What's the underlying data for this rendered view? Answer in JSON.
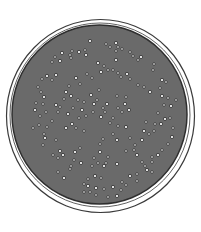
{
  "figure": {
    "subject": "Petri dish with bacterial colonies",
    "colors": {
      "background": "#ffffff",
      "rim_line": "#3a3a3a",
      "rim_fill": "#ffffff",
      "agar": "#6a6a6a",
      "agar_edge": "#2e2e2e",
      "colony_fill": "#f4f4f4",
      "colony_outline": "#1e1e1e"
    },
    "dish": {
      "outer": {
        "cx": 100.5,
        "cy": 116,
        "rx": 94,
        "ry": 96.5
      },
      "inner_rim": {
        "cx": 100,
        "cy": 115,
        "rx": 90,
        "ry": 92
      },
      "agar": {
        "cx": 99.5,
        "cy": 114.5,
        "rx": 87.5,
        "ry": 89.5
      }
    },
    "colonies": [
      [
        90,
        41
      ],
      [
        106,
        44
      ],
      [
        110,
        47
      ],
      [
        116,
        43
      ],
      [
        118,
        47
      ],
      [
        85,
        50
      ],
      [
        86,
        55
      ],
      [
        122,
        49
      ],
      [
        130,
        52
      ],
      [
        62,
        53
      ],
      [
        70,
        55
      ],
      [
        72,
        51
      ],
      [
        79,
        52
      ],
      [
        55,
        57
      ],
      [
        52,
        62
      ],
      [
        60,
        61
      ],
      [
        71,
        58
      ],
      [
        116,
        51
      ],
      [
        116,
        60
      ],
      [
        133,
        56
      ],
      [
        138,
        60
      ],
      [
        141,
        57
      ],
      [
        154,
        64
      ],
      [
        153,
        70
      ],
      [
        98,
        63
      ],
      [
        104,
        66
      ],
      [
        108,
        70
      ],
      [
        101,
        72
      ],
      [
        113,
        70
      ],
      [
        118,
        73
      ],
      [
        127,
        74
      ],
      [
        130,
        79
      ],
      [
        121,
        77
      ],
      [
        47,
        76
      ],
      [
        42,
        79
      ],
      [
        52,
        80
      ],
      [
        56,
        75
      ],
      [
        87,
        74
      ],
      [
        92,
        78
      ],
      [
        162,
        80
      ],
      [
        166,
        82
      ],
      [
        160,
        88
      ],
      [
        150,
        92
      ],
      [
        144,
        87
      ],
      [
        138,
        85
      ],
      [
        76,
        78
      ],
      [
        80,
        84
      ],
      [
        69,
        86
      ],
      [
        66,
        92
      ],
      [
        38,
        87
      ],
      [
        41,
        92
      ],
      [
        44,
        97
      ],
      [
        36,
        103
      ],
      [
        43,
        104
      ],
      [
        35,
        110
      ],
      [
        40,
        116
      ],
      [
        46,
        112
      ],
      [
        56,
        105
      ],
      [
        60,
        107
      ],
      [
        64,
        99
      ],
      [
        71,
        96
      ],
      [
        78,
        100
      ],
      [
        84,
        102
      ],
      [
        91,
        95
      ],
      [
        99,
        90
      ],
      [
        97,
        100
      ],
      [
        94,
        104
      ],
      [
        103,
        108
      ],
      [
        105,
        112
      ],
      [
        107,
        104
      ],
      [
        117,
        96
      ],
      [
        126,
        97
      ],
      [
        125,
        104
      ],
      [
        118,
        108
      ],
      [
        122,
        112
      ],
      [
        129,
        110
      ],
      [
        113,
        118
      ],
      [
        110,
        123
      ],
      [
        101,
        117
      ],
      [
        93,
        112
      ],
      [
        86,
        116
      ],
      [
        82,
        110
      ],
      [
        79,
        118
      ],
      [
        73,
        108
      ],
      [
        68,
        114
      ],
      [
        58,
        112
      ],
      [
        52,
        121
      ],
      [
        72,
        124
      ],
      [
        76,
        128
      ],
      [
        84,
        131
      ],
      [
        66,
        128
      ],
      [
        47,
        127
      ],
      [
        44,
        134
      ],
      [
        45,
        138
      ],
      [
        43,
        145
      ],
      [
        56,
        140
      ],
      [
        162,
        96
      ],
      [
        168,
        98
      ],
      [
        164,
        105
      ],
      [
        171,
        106
      ],
      [
        176,
        100
      ],
      [
        158,
        113
      ],
      [
        165,
        119
      ],
      [
        170,
        118
      ],
      [
        173,
        128
      ],
      [
        161,
        124
      ],
      [
        155,
        124
      ],
      [
        146,
        122
      ],
      [
        144,
        131
      ],
      [
        149,
        134
      ],
      [
        154,
        131
      ],
      [
        142,
        140
      ],
      [
        135,
        145
      ],
      [
        130,
        138
      ],
      [
        126,
        127
      ],
      [
        118,
        126
      ],
      [
        113,
        134
      ],
      [
        117,
        140
      ],
      [
        103,
        139
      ],
      [
        100,
        144
      ],
      [
        100,
        152
      ],
      [
        94,
        158
      ],
      [
        98,
        163
      ],
      [
        104,
        166
      ],
      [
        106,
        163
      ],
      [
        108,
        157
      ],
      [
        117,
        164
      ],
      [
        126,
        151
      ],
      [
        134,
        150
      ],
      [
        137,
        155
      ],
      [
        142,
        162
      ],
      [
        152,
        157
      ],
      [
        158,
        155
      ],
      [
        162,
        150
      ],
      [
        168,
        144
      ],
      [
        172,
        137
      ],
      [
        152,
        162
      ],
      [
        145,
        166
      ],
      [
        147,
        170
      ],
      [
        152,
        172
      ],
      [
        137,
        174
      ],
      [
        130,
        176
      ],
      [
        137,
        181
      ],
      [
        126,
        185
      ],
      [
        113,
        187
      ],
      [
        121,
        190
      ],
      [
        104,
        189
      ],
      [
        96,
        188
      ],
      [
        90,
        192
      ],
      [
        96,
        195
      ],
      [
        88,
        186
      ],
      [
        84,
        184
      ],
      [
        101,
        178
      ],
      [
        95,
        176
      ],
      [
        88,
        179
      ],
      [
        92,
        166
      ],
      [
        81,
        163
      ],
      [
        74,
        160
      ],
      [
        71,
        166
      ],
      [
        63,
        155
      ],
      [
        58,
        158
      ],
      [
        53,
        155
      ],
      [
        60,
        151
      ],
      [
        33,
        128
      ],
      [
        39,
        125
      ],
      [
        75,
        152
      ],
      [
        80,
        148
      ],
      [
        58,
        172
      ],
      [
        64,
        178
      ],
      [
        70,
        169
      ],
      [
        122,
        182
      ],
      [
        117,
        196
      ],
      [
        108,
        197
      ],
      [
        84,
        192
      ]
    ]
  }
}
